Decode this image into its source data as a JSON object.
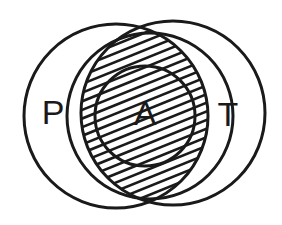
{
  "diagram": {
    "type": "venn-diagram",
    "background_color": "#ffffff",
    "stroke_color": "#1a1a1a",
    "hatch_color": "#1a1a1a",
    "labels": {
      "p": "P",
      "a": "A",
      "t": "T"
    },
    "label_font_size": "34",
    "regions": [
      {
        "id": "p-region",
        "label": "P",
        "shaded": false,
        "shape": "circle",
        "cx": 116,
        "cy": 116,
        "r": 92,
        "stroke_width": 3,
        "label_x": 53,
        "label_y": 115
      },
      {
        "id": "middle-region",
        "label": "",
        "shaded": false,
        "shape": "circle",
        "cx": 150,
        "cy": 116,
        "r": 83,
        "stroke_width": 3,
        "label_x": 0,
        "label_y": 0
      },
      {
        "id": "a-region",
        "label": "A",
        "shaded": false,
        "shape": "circle",
        "cx": 145,
        "cy": 116,
        "r": 50,
        "stroke_width": 3,
        "label_x": 145,
        "label_y": 116
      },
      {
        "id": "t-region",
        "label": "T",
        "shaded": true,
        "shape": "circle",
        "cx": 173,
        "cy": 113,
        "r": 92,
        "stroke_width": 3,
        "label_x": 228,
        "label_y": 117
      }
    ],
    "hatching": {
      "angle_degrees": 22,
      "spacing": 8,
      "line_width": 2.6,
      "applies_to": "t-region"
    }
  }
}
